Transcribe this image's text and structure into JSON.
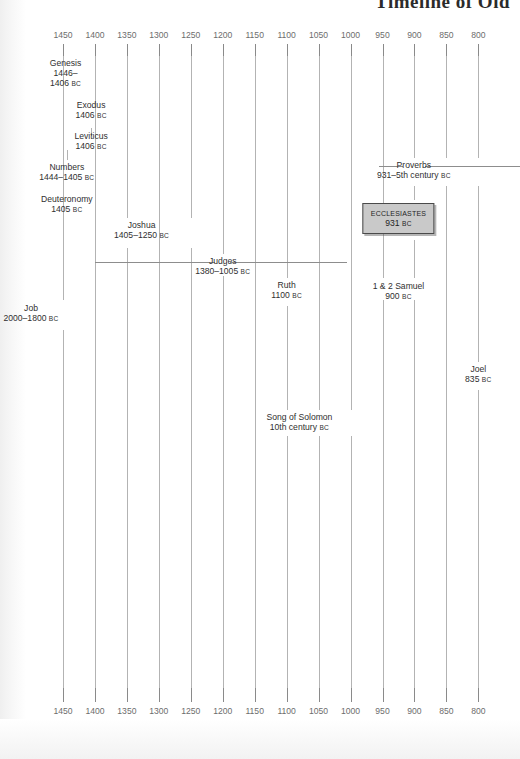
{
  "title": "Timeline of Old",
  "chart_data": {
    "type": "timeline",
    "title": "Timeline of Old",
    "xlabel": "",
    "ylabel": "",
    "era_suffix": "BC",
    "axis_direction": "descending",
    "xlim": [
      1450,
      800
    ],
    "grid": true,
    "legend": null,
    "axis": {
      "top_ticks": [
        "1450",
        "1400",
        "1350",
        "1300",
        "1250",
        "1200",
        "1150",
        "1100",
        "1050",
        "1000",
        "950",
        "900",
        "850",
        "800"
      ],
      "bottom_ticks": [
        "1450",
        "1400",
        "1350",
        "1300",
        "1250",
        "1200",
        "1150",
        "1100",
        "1050",
        "1000",
        "950",
        "900",
        "850",
        "800"
      ],
      "tick_values": [
        1450,
        1400,
        1350,
        1300,
        1250,
        1200,
        1150,
        1100,
        1050,
        1000,
        950,
        900,
        850,
        800
      ]
    },
    "events": [
      {
        "name": "Genesis",
        "date": "1446-\n1406",
        "era": "BC",
        "start": 1446,
        "end": 1406,
        "anchor": 1446,
        "kind": "point"
      },
      {
        "name": "Exodus",
        "date": "1406",
        "era": "BC",
        "start": 1406,
        "end": 1406,
        "anchor": 1406,
        "kind": "point"
      },
      {
        "name": "Leviticus",
        "date": "1406",
        "era": "BC",
        "start": 1406,
        "end": 1406,
        "anchor": 1406,
        "kind": "point"
      },
      {
        "name": "Numbers",
        "date": "1444–1405",
        "era": "BC",
        "start": 1444,
        "end": 1405,
        "anchor": 1444,
        "kind": "point"
      },
      {
        "name": "Deuteronomy",
        "date": "1405",
        "era": "BC",
        "start": 1405,
        "end": 1405,
        "anchor": 1444,
        "kind": "point"
      },
      {
        "name": "Joshua",
        "date": "1405–1250",
        "era": "BC",
        "start": 1405,
        "end": 1250,
        "anchor": 1350,
        "kind": "point"
      },
      {
        "name": "Judges",
        "date": "1380–1005",
        "era": "BC",
        "start": 1380,
        "end": 1005,
        "anchor": 1200,
        "kind": "span"
      },
      {
        "name": "Ruth",
        "date": "1100",
        "era": "BC",
        "start": 1100,
        "end": 1100,
        "anchor": 1100,
        "kind": "point"
      },
      {
        "name": "Job",
        "date": "2000–1800",
        "era": "BC",
        "start": 2000,
        "end": 1800,
        "anchor": 1450,
        "kind": "point"
      },
      {
        "name": "Proverbs",
        "date": "931–5th century",
        "era": "BC",
        "start": 931,
        "end": 400,
        "anchor": 900,
        "kind": "span"
      },
      {
        "name": "Ecclesiastes",
        "date": "931",
        "era": "BC",
        "start": 931,
        "end": 931,
        "anchor": 925,
        "kind": "highlight"
      },
      {
        "name": "1 & 2 Samuel",
        "date": "900",
        "era": "BC",
        "start": 900,
        "end": 900,
        "anchor": 925,
        "kind": "point"
      },
      {
        "name": "Song of Solomon",
        "date": "10th century",
        "era": "BC",
        "start": 1000,
        "end": 901,
        "anchor": 1080,
        "kind": "point"
      },
      {
        "name": "Joel",
        "date": "835",
        "era": "BC",
        "start": 835,
        "end": 835,
        "anchor": 800,
        "kind": "point"
      }
    ]
  },
  "events_text": {
    "genesis": {
      "name": "Genesis",
      "line1": "1446–",
      "line2": "1406",
      "era": "BC"
    },
    "exodus": {
      "name": "Exodus",
      "date": "1406",
      "era": "BC"
    },
    "leviticus": {
      "name": "Leviticus",
      "date": "1406",
      "era": "BC"
    },
    "numbers": {
      "name": "Numbers",
      "date": "1444–1405",
      "era": "BC"
    },
    "deuteronomy": {
      "name": "Deuteronomy",
      "date": "1405",
      "era": "BC"
    },
    "joshua": {
      "name": "Joshua",
      "date": "1405–1250",
      "era": "BC"
    },
    "judges": {
      "name": "Judges",
      "date": "1380–1005",
      "era": "BC"
    },
    "ruth": {
      "name": "Ruth",
      "date": "1100",
      "era": "BC"
    },
    "job": {
      "name": "Job",
      "date": "2000–1800",
      "era": "BC"
    },
    "proverbs": {
      "name": "Proverbs",
      "date": "931–5th century",
      "era": "BC"
    },
    "ecclesiastes": {
      "name": "Ecclesiastes",
      "date": "931",
      "era": "BC"
    },
    "samuel": {
      "name": "1 & 2 Samuel",
      "date": "900",
      "era": "BC"
    },
    "songofsolomon": {
      "name": "Song of Solomon",
      "date": "10th century",
      "era": "BC"
    },
    "joel": {
      "name": "Joel",
      "date": "835",
      "era": "BC"
    }
  },
  "colors": {
    "page_background": "#ffffff",
    "grid_line": "#b3b3b3",
    "tick_mark": "#8a8a8a",
    "tick_label": "#6d6d6d",
    "text": "#2f2f2f",
    "highlight_fill": "#c9c9c9",
    "highlight_border": "#4a4a4a"
  }
}
